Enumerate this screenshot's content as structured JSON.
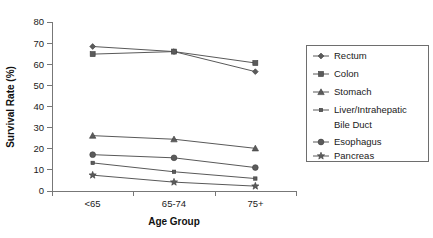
{
  "chart_data": {
    "type": "line",
    "title": "",
    "subtitle": "",
    "xlabel": "Age Group",
    "ylabel": "Survival Rate (%)",
    "categories": [
      "<65",
      "65-74",
      "75+"
    ],
    "ylim": [
      0,
      80
    ],
    "ytick_values": [
      0,
      10,
      20,
      30,
      40,
      50,
      60,
      70,
      80
    ],
    "ytick_labels": [
      "0",
      "10",
      "20",
      "30",
      "40",
      "50",
      "60",
      "70",
      "80"
    ],
    "grid": false,
    "legend_position": "right",
    "series": [
      {
        "name": "Rectum",
        "marker": "diamond",
        "values": [
          68.4,
          66.0,
          56.5
        ]
      },
      {
        "name": "Colon",
        "marker": "square",
        "values": [
          64.8,
          66.0,
          60.6
        ]
      },
      {
        "name": "Stomach",
        "marker": "triangle",
        "values": [
          26.2,
          24.5,
          20.2
        ]
      },
      {
        "name": "Liver/Intrahepatic Bile Duct",
        "marker": "small-square",
        "values": [
          13.3,
          9.1,
          5.9
        ]
      },
      {
        "name": "Esophagus",
        "marker": "circle",
        "values": [
          17.2,
          15.7,
          11.1
        ]
      },
      {
        "name": "Pancreas",
        "marker": "star",
        "values": [
          7.5,
          4.2,
          2.3
        ]
      }
    ]
  },
  "axes": {
    "y_title": "Survival Rate (%)",
    "x_title": "Age Group",
    "y_ticks": [
      "80",
      "70",
      "60",
      "50",
      "40",
      "30",
      "20",
      "10",
      "0"
    ],
    "x_ticks": [
      "<65",
      "65-74",
      "75+"
    ]
  },
  "legend": {
    "entries": [
      {
        "label": "Rectum",
        "marker": "diamond"
      },
      {
        "label": "Colon",
        "marker": "square"
      },
      {
        "label": "Stomach",
        "marker": "triangle"
      },
      {
        "label": "Liver/Intrahepatic",
        "label2": "Bile Duct",
        "marker": "small-square"
      },
      {
        "label": "Esophagus",
        "marker": "circle"
      },
      {
        "label": "Pancreas",
        "marker": "star"
      }
    ]
  },
  "colors": {
    "series": "#595959",
    "marker_fill": "#5b5b5b",
    "axis": "#777777",
    "text": "#1a1a1a",
    "background": "#ffffff"
  }
}
